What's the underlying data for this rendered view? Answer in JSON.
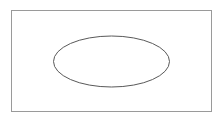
{
  "canvas": {
    "width": 224,
    "height": 121,
    "background_color": "#ffffff"
  },
  "diagram": {
    "shapes": [
      {
        "name": "outer-rectangle",
        "type": "rectangle",
        "x": 11.5,
        "y": 10.5,
        "width": 200,
        "height": 101,
        "stroke_color": "#9a9a9a",
        "stroke_width": 1,
        "fill_color": "none"
      },
      {
        "name": "inner-ellipse",
        "type": "ellipse",
        "cx": 111.5,
        "cy": 61.5,
        "rx": 58,
        "ry": 25.5,
        "stroke_color": "#595959",
        "stroke_width": 1,
        "fill_color": "none"
      }
    ]
  }
}
